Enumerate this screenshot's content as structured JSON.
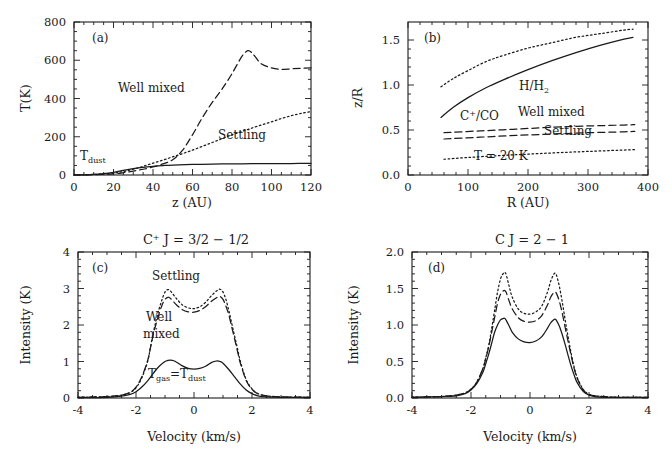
{
  "figure": {
    "panels": [
      "a",
      "b",
      "c",
      "d"
    ]
  },
  "panel_a": {
    "label": "(a)",
    "xlabel": "z (AU)",
    "ylabel": "T(K)",
    "xticks": [
      "0",
      "20",
      "40",
      "60",
      "80",
      "100",
      "120"
    ],
    "yticks": [
      "0",
      "200",
      "400",
      "600",
      "800"
    ],
    "annotations": {
      "well_mixed": "Well mixed",
      "settling": "Settling",
      "t_dust_main": "T",
      "t_dust_sub": "dust"
    },
    "chart_data": {
      "type": "line",
      "title": "",
      "xlabel": "z (AU)",
      "ylabel": "T(K)",
      "xlim": [
        0,
        120
      ],
      "ylim": [
        0,
        800
      ],
      "xticks": [
        0,
        20,
        40,
        60,
        80,
        100,
        120
      ],
      "yticks": [
        0,
        200,
        400,
        600,
        800
      ],
      "grid": false,
      "legend": "inline-annotations",
      "series": [
        {
          "name": "Well mixed",
          "style": "dashed",
          "x": [
            0,
            10,
            20,
            25,
            30,
            35,
            40,
            45,
            50,
            55,
            60,
            65,
            70,
            75,
            80,
            85,
            88,
            90,
            92,
            95,
            100,
            105,
            110,
            115,
            120
          ],
          "y": [
            0,
            2,
            6,
            12,
            20,
            30,
            42,
            58,
            80,
            130,
            210,
            300,
            380,
            450,
            530,
            620,
            650,
            640,
            615,
            580,
            560,
            552,
            555,
            558,
            560
          ]
        },
        {
          "name": "Settling",
          "style": "dotted",
          "x": [
            0,
            10,
            20,
            25,
            30,
            35,
            40,
            45,
            50,
            55,
            60,
            65,
            70,
            75,
            80,
            85,
            90,
            95,
            100,
            105,
            110,
            115,
            120
          ],
          "y": [
            0,
            3,
            10,
            18,
            30,
            45,
            62,
            78,
            95,
            112,
            130,
            150,
            170,
            190,
            210,
            228,
            245,
            262,
            278,
            295,
            310,
            322,
            332
          ]
        },
        {
          "name": "T_dust",
          "style": "solid",
          "x": [
            0,
            5,
            10,
            15,
            20,
            25,
            30,
            35,
            40,
            45,
            50,
            60,
            70,
            80,
            90,
            100,
            110,
            120
          ],
          "y": [
            0,
            1,
            3,
            7,
            14,
            24,
            33,
            40,
            45,
            49,
            52,
            55,
            57,
            58,
            59,
            60,
            60,
            61
          ]
        }
      ]
    }
  },
  "panel_b": {
    "label": "(b)",
    "xlabel": "R (AU)",
    "ylabel": "z/R",
    "xticks": [
      "0",
      "100",
      "200",
      "300",
      "400"
    ],
    "yticks": [
      "0.0",
      "0.5",
      "1.0",
      "1.5"
    ],
    "annotations": {
      "h_h2_main": "H/H",
      "h_h2_sub": "2",
      "cplus_co_main": "C",
      "cplus_co_sup": "+",
      "cplus_co_rest": "/CO",
      "well_mixed": "Well mixed",
      "settling": "Settling",
      "t20k": "T = 20 K"
    },
    "chart_data": {
      "type": "line",
      "title": "",
      "xlabel": "R (AU)",
      "ylabel": "z/R",
      "xlim": [
        0,
        400
      ],
      "ylim": [
        0.0,
        1.7
      ],
      "xticks": [
        0,
        100,
        200,
        300,
        400
      ],
      "yticks": [
        0.0,
        0.5,
        1.0,
        1.5
      ],
      "grid": false,
      "legend": "inline-annotations",
      "series": [
        {
          "name": "H/H2 settling (upper dotted)",
          "style": "dotted",
          "x": [
            55,
            75,
            100,
            130,
            160,
            200,
            240,
            280,
            320,
            360,
            375
          ],
          "y": [
            0.98,
            1.07,
            1.16,
            1.26,
            1.33,
            1.41,
            1.47,
            1.53,
            1.57,
            1.61,
            1.62
          ]
        },
        {
          "name": "H/H2 well mixed (solid)",
          "style": "solid",
          "x": [
            55,
            75,
            100,
            130,
            160,
            200,
            240,
            280,
            320,
            360,
            375
          ],
          "y": [
            0.64,
            0.75,
            0.86,
            0.97,
            1.06,
            1.17,
            1.27,
            1.36,
            1.44,
            1.51,
            1.53
          ]
        },
        {
          "name": "C+/CO well mixed (upper dashed)",
          "style": "dashed",
          "x": [
            60,
            120,
            180,
            240,
            300,
            360,
            378
          ],
          "y": [
            0.47,
            0.49,
            0.51,
            0.53,
            0.545,
            0.555,
            0.56
          ]
        },
        {
          "name": "C+/CO settling (lower dashed)",
          "style": "dashed",
          "x": [
            60,
            120,
            180,
            240,
            300,
            360,
            378
          ],
          "y": [
            0.4,
            0.42,
            0.44,
            0.455,
            0.47,
            0.48,
            0.485
          ]
        },
        {
          "name": "T = 20 K",
          "style": "dotted",
          "x": [
            60,
            100,
            150,
            200,
            250,
            300,
            350,
            378
          ],
          "y": [
            0.175,
            0.195,
            0.215,
            0.232,
            0.248,
            0.262,
            0.275,
            0.282
          ]
        }
      ]
    }
  },
  "panel_c": {
    "label": "(c)",
    "title_main": "C",
    "title_sup": "+",
    "title_rest": " J = 3/2 − 1/2",
    "title_full": "C+ J = 3/2 - 1/2",
    "xlabel": "Velocity (km/s)",
    "ylabel": "Intensity (K)",
    "xticks": [
      "-4",
      "-2",
      "0",
      "2",
      "4"
    ],
    "yticks": [
      "0",
      "1",
      "2",
      "3",
      "4"
    ],
    "annotations": {
      "settling": "Settling",
      "well": "Well",
      "mixed": "mixed",
      "tgas_main": "T",
      "tgas_sub": "gas",
      "eq": "=T",
      "tdust_sub": "dust"
    },
    "chart_data": {
      "type": "line",
      "title": "C+ J = 3/2 - 1/2",
      "xlabel": "Velocity (km/s)",
      "ylabel": "Intensity (K)",
      "xlim": [
        -4,
        4
      ],
      "ylim": [
        0,
        4
      ],
      "xticks": [
        -4,
        -2,
        0,
        2,
        4
      ],
      "yticks": [
        0,
        1,
        2,
        3,
        4
      ],
      "grid": false,
      "legend": "inline-annotations",
      "series": [
        {
          "name": "Settling",
          "style": "dotted",
          "x": [
            -4.0,
            -3.0,
            -2.5,
            -2.2,
            -2.0,
            -1.8,
            -1.6,
            -1.5,
            -1.4,
            -1.3,
            -1.2,
            -1.1,
            -1.0,
            -0.9,
            -0.8,
            -0.6,
            -0.4,
            -0.2,
            0.0,
            0.2,
            0.4,
            0.6,
            0.8,
            0.9,
            1.0,
            1.1,
            1.2,
            1.3,
            1.4,
            1.5,
            1.6,
            1.8,
            2.0,
            2.2,
            2.5,
            3.0,
            4.0
          ],
          "y": [
            0.02,
            0.04,
            0.08,
            0.15,
            0.28,
            0.55,
            1.0,
            1.4,
            1.8,
            2.15,
            2.45,
            2.7,
            2.9,
            2.97,
            2.92,
            2.72,
            2.55,
            2.47,
            2.45,
            2.5,
            2.62,
            2.8,
            2.95,
            2.98,
            2.9,
            2.7,
            2.4,
            2.05,
            1.7,
            1.35,
            1.0,
            0.5,
            0.25,
            0.12,
            0.06,
            0.03,
            0.02
          ]
        },
        {
          "name": "Well mixed",
          "style": "dashed",
          "x": [
            -4.0,
            -3.0,
            -2.5,
            -2.2,
            -2.0,
            -1.8,
            -1.6,
            -1.5,
            -1.4,
            -1.3,
            -1.2,
            -1.1,
            -1.0,
            -0.9,
            -0.8,
            -0.6,
            -0.4,
            -0.2,
            0.0,
            0.2,
            0.4,
            0.6,
            0.8,
            0.9,
            1.0,
            1.1,
            1.2,
            1.3,
            1.4,
            1.5,
            1.6,
            1.8,
            2.0,
            2.2,
            2.5,
            3.0,
            4.0
          ],
          "y": [
            0.02,
            0.04,
            0.08,
            0.16,
            0.3,
            0.58,
            1.02,
            1.38,
            1.75,
            2.05,
            2.32,
            2.55,
            2.7,
            2.76,
            2.72,
            2.55,
            2.42,
            2.36,
            2.35,
            2.4,
            2.5,
            2.65,
            2.76,
            2.78,
            2.7,
            2.52,
            2.28,
            1.95,
            1.62,
            1.28,
            0.95,
            0.48,
            0.24,
            0.12,
            0.06,
            0.03,
            0.02
          ]
        },
        {
          "name": "T_gas = T_dust",
          "style": "solid",
          "x": [
            -4.0,
            -3.0,
            -2.5,
            -2.2,
            -2.0,
            -1.8,
            -1.6,
            -1.4,
            -1.2,
            -1.0,
            -0.9,
            -0.8,
            -0.7,
            -0.6,
            -0.4,
            -0.2,
            0.0,
            0.2,
            0.4,
            0.6,
            0.7,
            0.8,
            0.9,
            1.0,
            1.2,
            1.4,
            1.6,
            1.8,
            2.0,
            2.2,
            2.5,
            3.0,
            4.0
          ],
          "y": [
            0.01,
            0.02,
            0.05,
            0.1,
            0.17,
            0.3,
            0.47,
            0.68,
            0.87,
            1.0,
            1.03,
            1.04,
            1.02,
            0.98,
            0.88,
            0.81,
            0.79,
            0.81,
            0.87,
            0.97,
            1.0,
            1.02,
            1.0,
            0.95,
            0.78,
            0.58,
            0.38,
            0.22,
            0.12,
            0.06,
            0.03,
            0.02,
            0.01
          ]
        }
      ]
    }
  },
  "panel_d": {
    "label": "(d)",
    "title_full": "C J = 2 − 1",
    "xlabel": "Velocity (km/s)",
    "ylabel": "Intensity (K)",
    "xticks": [
      "-4",
      "-2",
      "0",
      "2",
      "4"
    ],
    "yticks": [
      "0.0",
      "0.5",
      "1.0",
      "1.5",
      "2.0"
    ],
    "chart_data": {
      "type": "line",
      "title": "C J = 2 - 1",
      "xlabel": "Velocity (km/s)",
      "ylabel": "Intensity (K)",
      "xlim": [
        -4,
        4
      ],
      "ylim": [
        0.0,
        2.0
      ],
      "xticks": [
        -4,
        -2,
        0,
        2,
        4
      ],
      "yticks": [
        0.0,
        0.5,
        1.0,
        1.5,
        2.0
      ],
      "grid": false,
      "legend": "none",
      "series": [
        {
          "name": "Settling",
          "style": "dotted",
          "x": [
            -4.0,
            -3.0,
            -2.5,
            -2.2,
            -2.0,
            -1.8,
            -1.6,
            -1.5,
            -1.4,
            -1.3,
            -1.2,
            -1.1,
            -1.0,
            -0.9,
            -0.85,
            -0.8,
            -0.7,
            -0.6,
            -0.4,
            -0.2,
            0.0,
            0.2,
            0.4,
            0.6,
            0.7,
            0.8,
            0.85,
            0.9,
            1.0,
            1.1,
            1.2,
            1.3,
            1.4,
            1.5,
            1.6,
            1.8,
            2.0,
            2.2,
            2.5,
            3.0,
            4.0
          ],
          "y": [
            0.01,
            0.02,
            0.04,
            0.07,
            0.12,
            0.22,
            0.4,
            0.55,
            0.72,
            0.95,
            1.2,
            1.45,
            1.63,
            1.71,
            1.72,
            1.68,
            1.52,
            1.38,
            1.22,
            1.16,
            1.15,
            1.18,
            1.26,
            1.46,
            1.6,
            1.69,
            1.71,
            1.68,
            1.52,
            1.3,
            1.05,
            0.82,
            0.6,
            0.42,
            0.28,
            0.12,
            0.05,
            0.03,
            0.02,
            0.01,
            0.01
          ]
        },
        {
          "name": "Well mixed",
          "style": "dashed",
          "x": [
            -4.0,
            -3.0,
            -2.5,
            -2.2,
            -2.0,
            -1.8,
            -1.6,
            -1.5,
            -1.4,
            -1.3,
            -1.2,
            -1.1,
            -1.0,
            -0.9,
            -0.85,
            -0.8,
            -0.7,
            -0.6,
            -0.4,
            -0.2,
            0.0,
            0.2,
            0.4,
            0.6,
            0.7,
            0.8,
            0.85,
            0.9,
            1.0,
            1.1,
            1.2,
            1.3,
            1.4,
            1.5,
            1.6,
            1.8,
            2.0,
            2.2,
            2.5,
            3.0,
            4.0
          ],
          "y": [
            0.01,
            0.02,
            0.04,
            0.07,
            0.12,
            0.22,
            0.4,
            0.54,
            0.7,
            0.9,
            1.1,
            1.3,
            1.42,
            1.47,
            1.47,
            1.44,
            1.32,
            1.22,
            1.1,
            1.05,
            1.04,
            1.06,
            1.13,
            1.28,
            1.38,
            1.44,
            1.45,
            1.43,
            1.32,
            1.15,
            0.95,
            0.76,
            0.57,
            0.4,
            0.27,
            0.11,
            0.05,
            0.03,
            0.02,
            0.01,
            0.01
          ]
        },
        {
          "name": "T_gas = T_dust",
          "style": "solid",
          "x": [
            -4.0,
            -3.0,
            -2.5,
            -2.2,
            -2.0,
            -1.8,
            -1.6,
            -1.5,
            -1.4,
            -1.3,
            -1.2,
            -1.1,
            -1.0,
            -0.9,
            -0.85,
            -0.8,
            -0.7,
            -0.6,
            -0.4,
            -0.2,
            0.0,
            0.2,
            0.4,
            0.6,
            0.7,
            0.8,
            0.85,
            0.9,
            1.0,
            1.1,
            1.2,
            1.3,
            1.4,
            1.5,
            1.6,
            1.8,
            2.0,
            2.2,
            2.5,
            3.0,
            4.0
          ],
          "y": [
            0.01,
            0.02,
            0.03,
            0.06,
            0.11,
            0.2,
            0.35,
            0.47,
            0.6,
            0.75,
            0.9,
            1.0,
            1.07,
            1.09,
            1.09,
            1.06,
            0.98,
            0.9,
            0.81,
            0.77,
            0.76,
            0.78,
            0.84,
            0.96,
            1.03,
            1.07,
            1.08,
            1.06,
            0.98,
            0.86,
            0.72,
            0.57,
            0.43,
            0.31,
            0.21,
            0.09,
            0.04,
            0.02,
            0.01,
            0.01,
            0.01
          ]
        }
      ]
    }
  }
}
